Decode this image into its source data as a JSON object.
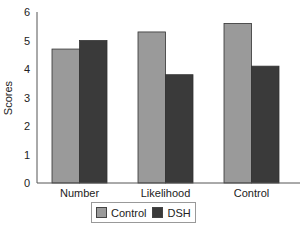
{
  "chart_data": {
    "type": "bar",
    "title": "",
    "xlabel": "",
    "ylabel": "Scores",
    "ylim": [
      0,
      6
    ],
    "yticks": [
      0,
      1,
      2,
      3,
      4,
      5,
      6
    ],
    "grid": false,
    "legend_position": "bottom",
    "categories": [
      "Number",
      "Likelihood",
      "Control"
    ],
    "series": [
      {
        "name": "Control",
        "color": "#9a9a9a",
        "values": [
          4.7,
          5.3,
          5.6
        ]
      },
      {
        "name": "DSH",
        "color": "#3a3a3a",
        "values": [
          5.0,
          3.8,
          4.1
        ]
      }
    ]
  },
  "legend": {
    "items": [
      {
        "label": "Control",
        "color": "#9a9a9a"
      },
      {
        "label": "DSH",
        "color": "#3a3a3a"
      }
    ]
  }
}
